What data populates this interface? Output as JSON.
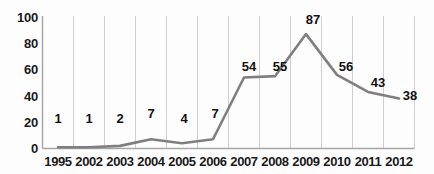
{
  "chart_data": {
    "type": "line",
    "title": "",
    "subtitle": "",
    "xlabel": "",
    "ylabel": "",
    "categories": [
      "1995",
      "2002",
      "2003",
      "2004",
      "2005",
      "2006",
      "2007",
      "2008",
      "2009",
      "2010",
      "2011",
      "2012"
    ],
    "values": [
      1,
      1,
      2,
      7,
      4,
      7,
      54,
      55,
      87,
      56,
      43,
      38
    ],
    "series": [
      {
        "name": "",
        "values": [
          1,
          1,
          2,
          7,
          4,
          7,
          54,
          55,
          87,
          56,
          43,
          38
        ],
        "color": "#7f7f7f"
      }
    ],
    "data_labels": [
      "1",
      "1",
      "2",
      "7",
      "4",
      "7",
      "54",
      "55",
      "87",
      "56",
      "43",
      "38"
    ],
    "ylim": [
      0,
      100
    ],
    "y_ticks": [
      0,
      20,
      40,
      60,
      80,
      100
    ],
    "y_tick_labels": [
      "0",
      "20",
      "40",
      "60",
      "80",
      "100"
    ],
    "grid": "vertical",
    "legend": "none",
    "line_color": "#808080",
    "axis_color": "#a6a6a6",
    "grid_color": "#cfcfcf",
    "text_color": "#1a1a1a",
    "background": "#fdfdfd"
  }
}
